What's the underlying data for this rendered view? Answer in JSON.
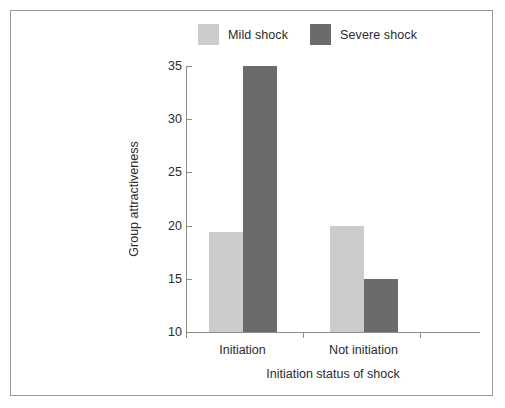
{
  "chart_data": {
    "type": "bar",
    "title": "",
    "subtitle": "",
    "xlabel": "Initiation status of shock",
    "ylabel": "Group attractiveness",
    "categories": [
      "Initiation",
      "Not initiation"
    ],
    "series": [
      {
        "name": "Mild shock",
        "color": "#cccccc",
        "values": [
          19.4,
          20.0
        ]
      },
      {
        "name": "Severe shock",
        "color": "#6b6b6b",
        "values": [
          35.0,
          15.0
        ]
      }
    ],
    "ylim": [
      10,
      35
    ],
    "ytick_labels": [
      "10",
      "15",
      "20",
      "25",
      "30",
      "35"
    ],
    "ytick_values": [
      10,
      15,
      20,
      25,
      30,
      35
    ],
    "grid": false,
    "legend_position": "top-center",
    "baseline": 10
  },
  "legend": {
    "entries": [
      {
        "label": "Mild shock",
        "color": "#cccccc"
      },
      {
        "label": "Severe shock",
        "color": "#6b6b6b"
      }
    ]
  },
  "axis": {
    "y_title": "Group attractiveness",
    "x_title": "Initiation status of shock",
    "y_ticks": [
      "10",
      "15",
      "20",
      "25",
      "30",
      "35"
    ],
    "x_categories": [
      "Initiation",
      "Not initiation"
    ]
  },
  "colors": {
    "mild": "#cccccc",
    "severe": "#6b6b6b",
    "axis": "#8c8c8c",
    "frame": "#9a9a9a",
    "text": "#2b2b2b",
    "background": "#ffffff"
  }
}
